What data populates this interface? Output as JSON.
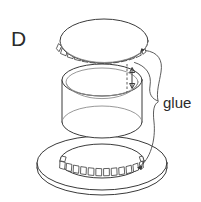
{
  "figure": {
    "panel_letter": "D",
    "background_color": "#ffffff",
    "line_color": "#3a3a3a",
    "light_line_color": "#8c8c8c",
    "text_color": "#2b2b2b",
    "callout_label": "glue",
    "parts": {
      "lid_name": "lid-disc",
      "cylinder_name": "cylinder-wall",
      "base_name": "base-annulus",
      "lid_tabs_name": "lid-tabs",
      "base_tabs_name": "base-tabs"
    },
    "annotations": {
      "height_dimension_name": "wall-height-dimension"
    }
  }
}
